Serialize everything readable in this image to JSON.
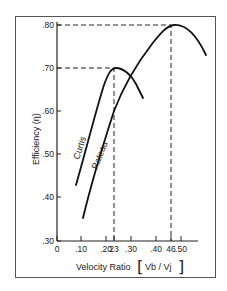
{
  "chart_data": {
    "type": "line",
    "title": "",
    "xlabel": "Velocity Ratio [Vb / Vj]",
    "ylabel": "Efficiency (η)",
    "xlim": [
      0,
      0.58
    ],
    "ylim": [
      0.3,
      0.8
    ],
    "grid": false,
    "legend": "inline curve labels",
    "x_ticks": [
      "0",
      ".10",
      ".20",
      ".23",
      ".30",
      ".40",
      ".46",
      ".50"
    ],
    "x_tick_values": [
      0,
      0.1,
      0.2,
      0.23,
      0.3,
      0.4,
      0.46,
      0.5
    ],
    "y_ticks": [
      ".30",
      ".40",
      ".50",
      ".60",
      ".70",
      ".80"
    ],
    "y_tick_values": [
      0.3,
      0.4,
      0.5,
      0.6,
      0.7,
      0.8
    ],
    "series": [
      {
        "name": "Curtis",
        "x": [
          0.077,
          0.12,
          0.16,
          0.2,
          0.23,
          0.27,
          0.31,
          0.35
        ],
        "y": [
          0.43,
          0.53,
          0.62,
          0.685,
          0.7,
          0.69,
          0.665,
          0.63
        ]
      },
      {
        "name": "Rateau",
        "x": [
          0.105,
          0.15,
          0.2,
          0.23,
          0.3,
          0.38,
          0.46,
          0.52,
          0.58
        ],
        "y": [
          0.355,
          0.455,
          0.56,
          0.6,
          0.69,
          0.765,
          0.8,
          0.785,
          0.73
        ]
      }
    ],
    "annotations": [
      {
        "type": "dashed-guide",
        "x": 0.23,
        "y": 0.7,
        "note": "Curtis peak"
      },
      {
        "type": "dashed-guide",
        "x": 0.46,
        "y": 0.8,
        "note": "Rateau peak"
      }
    ]
  },
  "labels": {
    "y_axis": "Efficiency (η)",
    "x_axis_text": "Velocity Ratio",
    "x_axis_formula": "Vb / Vj",
    "curtis": "Curtis",
    "rateau": "Rateau"
  },
  "ticks": {
    "x": [
      {
        "label": "0",
        "x": 57
      },
      {
        "label": ".10",
        "x": 81
      },
      {
        "label": ".20",
        "x": 106
      },
      {
        "label": "23",
        "x": 114
      },
      {
        "label": ".30",
        "x": 131
      },
      {
        "label": ".40",
        "x": 156
      },
      {
        "label": "46",
        "x": 171
      },
      {
        "label": ".50",
        "x": 181
      }
    ],
    "y": [
      {
        "label": ".80",
        "y": 25
      },
      {
        "label": ".70",
        "y": 68
      },
      {
        "label": ".60",
        "y": 111
      },
      {
        "label": ".50",
        "y": 154
      },
      {
        "label": ".40",
        "y": 197
      },
      {
        "label": ".30",
        "y": 241
      }
    ]
  }
}
